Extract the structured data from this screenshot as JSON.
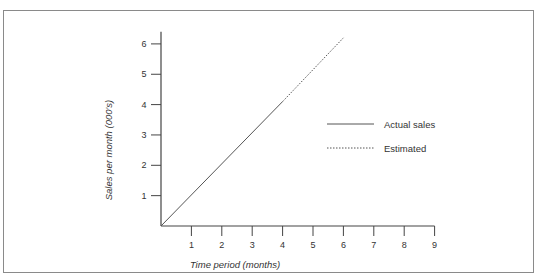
{
  "chart_data": {
    "type": "line",
    "title": "",
    "xlabel": "Time period (months)",
    "ylabel": "Sales per month (000's)",
    "xlim": [
      0,
      9
    ],
    "ylim": [
      0,
      6.3
    ],
    "xticks": [
      "1",
      "2",
      "3",
      "4",
      "5",
      "6",
      "7",
      "8",
      "9"
    ],
    "yticks": [
      "1",
      "2",
      "3",
      "4",
      "5",
      "6"
    ],
    "grid": false,
    "legend_position": "right-center",
    "series": [
      {
        "name": "Actual sales",
        "style": "solid",
        "color": "#555555",
        "x": [
          0,
          4
        ],
        "y": [
          0,
          4.1
        ]
      },
      {
        "name": "Estimated",
        "style": "dashed",
        "color": "#555555",
        "x": [
          4,
          6
        ],
        "y": [
          4.1,
          6.2
        ]
      }
    ]
  },
  "legend": {
    "items": [
      {
        "label": "Actual sales",
        "style": "solid"
      },
      {
        "label": "Estimated",
        "style": "dashed"
      }
    ]
  },
  "colors": {
    "axis": "#444444",
    "line": "#555555",
    "frame": "#8a8a8a"
  }
}
